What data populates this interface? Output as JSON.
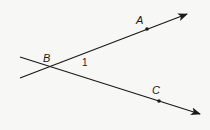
{
  "diagram": {
    "type": "geometry-angle",
    "rays": [
      {
        "name": "ray-BA",
        "from": [
          20,
          78
        ],
        "to": [
          187,
          14
        ],
        "through": "A"
      },
      {
        "name": "ray-BC",
        "from": [
          20,
          57
        ],
        "to": [
          200,
          114
        ],
        "through": "C"
      }
    ],
    "points": {
      "A": {
        "label": "A",
        "dot": [
          147,
          29
        ],
        "label_pos": [
          136,
          24
        ]
      },
      "B": {
        "label": "B",
        "vertex": [
          49,
          67
        ],
        "label_pos": [
          43,
          62
        ]
      },
      "C": {
        "label": "C",
        "dot": [
          159,
          101
        ],
        "label_pos": [
          152,
          94
        ]
      }
    },
    "angle_label": {
      "text": "1",
      "pos": [
        82,
        66
      ]
    },
    "colors": {
      "stroke": "#1a1a1a",
      "background": "#f7f7f5"
    }
  }
}
